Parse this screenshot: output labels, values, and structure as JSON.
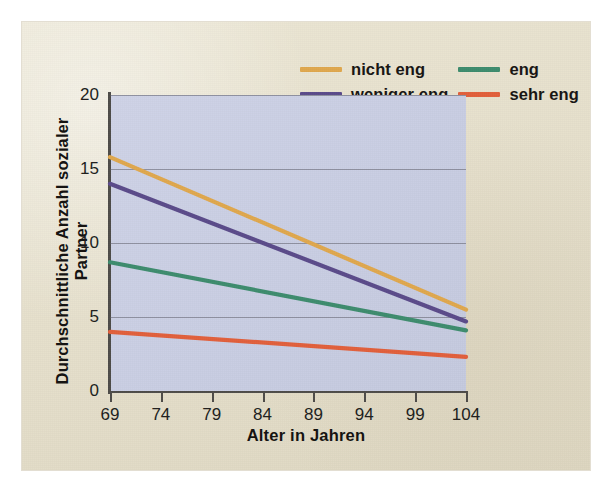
{
  "figure": {
    "background_color": "#e9e3d0",
    "plot_background_color": "#ccd1e5"
  },
  "axes": {
    "x_title": "Alter in Jahren",
    "y_title": "Durchschnittliche Anzahl sozialer Partner",
    "x_ticks": [
      "69",
      "74",
      "79",
      "84",
      "89",
      "94",
      "99",
      "104"
    ],
    "y_ticks": [
      "0",
      "5",
      "10",
      "15",
      "20"
    ]
  },
  "legend": {
    "entries": [
      {
        "label": "nicht eng",
        "color": "#e0a84e"
      },
      {
        "label": "eng",
        "color": "#3e8c6e"
      },
      {
        "label": "weniger eng",
        "color": "#5b4b8a"
      },
      {
        "label": "sehr eng",
        "color": "#e2603c"
      }
    ]
  },
  "chart_data": {
    "type": "line",
    "title": "",
    "xlabel": "Alter in Jahren",
    "ylabel": "Durchschnittliche Anzahl sozialer Partner",
    "x": [
      69,
      104
    ],
    "xlim": [
      69,
      104
    ],
    "ylim": [
      0,
      20
    ],
    "xticks": [
      69,
      74,
      79,
      84,
      89,
      94,
      99,
      104
    ],
    "yticks": [
      0,
      5,
      10,
      15,
      20
    ],
    "grid": "horizontal",
    "legend_position": "above-plot-right",
    "series": [
      {
        "name": "nicht eng",
        "color": "#e0a84e",
        "values": [
          15.8,
          5.5
        ]
      },
      {
        "name": "weniger eng",
        "color": "#5b4b8a",
        "values": [
          14.0,
          4.7
        ]
      },
      {
        "name": "eng",
        "color": "#3e8c6e",
        "values": [
          8.7,
          4.1
        ]
      },
      {
        "name": "sehr eng",
        "color": "#e2603c",
        "values": [
          4.0,
          2.3
        ]
      }
    ]
  }
}
